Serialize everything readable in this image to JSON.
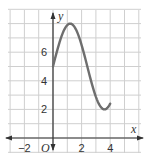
{
  "chart_data": {
    "type": "line",
    "title": "",
    "xlabel": "x",
    "ylabel": "y",
    "origin_label": "O",
    "xlim": [
      -2.5,
      5.5
    ],
    "ylim": [
      -1,
      9.5
    ],
    "grid": true,
    "x_tick_labels": [
      "−2",
      "2",
      "4"
    ],
    "x_tick_values": [
      -2,
      2,
      4
    ],
    "y_tick_labels": [
      "2",
      "4",
      "6"
    ],
    "y_tick_values": [
      2,
      4,
      6
    ],
    "series": [
      {
        "name": "curve",
        "color": "#6e6e6e",
        "x": [
          0,
          0.25,
          0.5,
          0.8,
          1.0,
          1.5,
          2.0,
          2.5,
          3.0,
          3.2,
          3.5,
          4.0
        ],
        "y": [
          5,
          6.9,
          7.8,
          8.0,
          7.9,
          6.9,
          5.0,
          3.1,
          2.1,
          2.0,
          2.6,
          5.0
        ]
      }
    ]
  },
  "colors": {
    "grid": "#cfcfcf",
    "axis": "#333333",
    "curve": "#6e6e6e"
  }
}
